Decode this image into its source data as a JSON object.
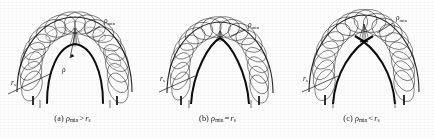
{
  "figure": {
    "name": "three-case-tube-envelope-figure",
    "background": "#ffffff",
    "ink": "#141414",
    "panel_count": 3
  },
  "panels": [
    {
      "id": "a",
      "caption_tag": "(a)",
      "caption_symbol": "ρ",
      "caption_symbol_sub": "min",
      "caption_relation": ">",
      "caption_operand": "r",
      "caption_operand_sub": "s",
      "caption_full": "(a) ρmin > rs",
      "labels": [
        {
          "name": "rho-min-label",
          "text": "ρ",
          "sub": "min",
          "x": 104,
          "y": 22
        },
        {
          "name": "rs-label",
          "text": "r",
          "sub": "s",
          "x": 13,
          "y": 83
        },
        {
          "name": "rho-label",
          "text": "ρ",
          "sub": "",
          "x": 63,
          "y": 70
        }
      ],
      "case": "rho-min-greater-than-rs",
      "apex": "rounded-open"
    },
    {
      "id": "b",
      "caption_tag": "(b)",
      "caption_symbol": "ρ",
      "caption_symbol_sub": "min",
      "caption_relation": "=",
      "caption_operand": "r",
      "caption_operand_sub": "s",
      "caption_full": "(b) ρmin = rs",
      "labels": [
        {
          "name": "rho-min-label",
          "text": "ρ",
          "sub": "min",
          "x": 104,
          "y": 26
        },
        {
          "name": "rs-label",
          "text": "r",
          "sub": "s",
          "x": 17,
          "y": 79
        }
      ],
      "case": "rho-min-equal-rs",
      "apex": "sharp-cusp"
    },
    {
      "id": "c",
      "caption_tag": "(c)",
      "caption_symbol": "ρ",
      "caption_symbol_sub": "min",
      "caption_relation": "<",
      "caption_operand": "r",
      "caption_operand_sub": "s",
      "caption_full": "(c) ρmin < rs",
      "labels": [
        {
          "name": "rho-min-label",
          "text": "ρ",
          "sub": "min",
          "x": 107,
          "y": 19
        },
        {
          "name": "rs-label",
          "text": "r",
          "sub": "s",
          "x": 16,
          "y": 79
        }
      ],
      "case": "rho-min-less-than-rs",
      "apex": "self-intersecting-crossed"
    }
  ]
}
